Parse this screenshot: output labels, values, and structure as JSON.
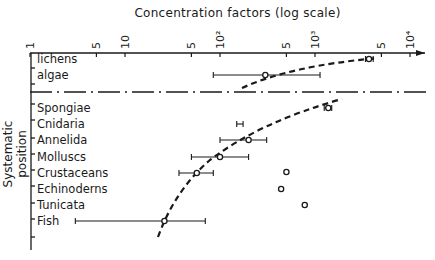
{
  "chart_data": {
    "type": "scatter",
    "title": "Concentration factors (log scale)",
    "xlabel": "Concentration factors (log scale)",
    "ylabel": "Systematic position",
    "xscale": "log",
    "xlim": [
      1,
      10000
    ],
    "x_ticks": [
      {
        "value": 1,
        "label": "1"
      },
      {
        "value": 5,
        "label": "5"
      },
      {
        "value": 10,
        "label": "10"
      },
      {
        "value": 50,
        "label": "5"
      },
      {
        "value": 100,
        "label": "10²"
      },
      {
        "value": 500,
        "label": "5"
      },
      {
        "value": 1000,
        "label": "10³"
      },
      {
        "value": 5000,
        "label": "5"
      },
      {
        "value": 10000,
        "label": "10⁴"
      }
    ],
    "groups": [
      {
        "name": "plants",
        "categories": [
          {
            "label": "lichens",
            "value": 3700,
            "err_low": 3400,
            "err_high": 4100
          },
          {
            "label": "algae",
            "value": 300,
            "err_low": 85,
            "err_high": 1130
          }
        ],
        "trend": "dashed curve"
      },
      {
        "name": "animals",
        "categories": [
          {
            "label": "Spongiae",
            "value": 1380,
            "err_low": 1250,
            "err_high": 1500
          },
          {
            "label": "Cnidaria",
            "value": null,
            "err_low": 150,
            "err_high": 175
          },
          {
            "label": "Annelida",
            "value": 200,
            "err_low": 100,
            "err_high": 310
          },
          {
            "label": "Molluscs",
            "value": 100,
            "err_low": 50,
            "err_high": 200
          },
          {
            "label": "Crustaceans",
            "value": 57,
            "err_low": 37,
            "err_high": 85,
            "extra_point": 500
          },
          {
            "label": "Echinoderns",
            "value": 440
          },
          {
            "label": "Tunicata",
            "value": 780
          },
          {
            "label": "Fish",
            "value": 26,
            "err_low": 3,
            "err_high": 70
          }
        ],
        "trend": "dashed curve"
      }
    ],
    "separator": "dash-dot line between plants and animals",
    "grid": false,
    "legend": null
  }
}
